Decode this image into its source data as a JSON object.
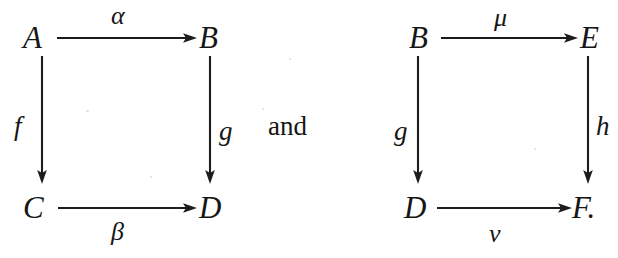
{
  "figure": {
    "kind": "commutative-diagram-pair",
    "background_color": "#ffffff",
    "ink_color": "#1a1a1a",
    "connective": "and",
    "diagrams": [
      {
        "id": "left-square",
        "objects": {
          "top_left": "A",
          "top_right": "B",
          "bottom_left": "C",
          "bottom_right": "D"
        },
        "morphisms": {
          "top": "α",
          "left": "f",
          "right": "g",
          "bottom": "β"
        }
      },
      {
        "id": "right-square",
        "objects": {
          "top_left": "B",
          "top_right": "E",
          "bottom_left": "D",
          "bottom_right": "F."
        },
        "morphisms": {
          "top": "μ",
          "left": "g",
          "right": "h",
          "bottom": "ν"
        }
      }
    ]
  }
}
